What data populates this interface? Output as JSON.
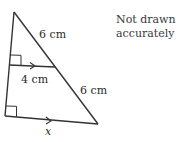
{
  "figure": {
    "note_line1": "Not drawn",
    "note_line2": "accurately",
    "labels": {
      "upper_hypotenuse": "6 cm",
      "lower_hypotenuse": "6 cm",
      "middle_parallel": "4 cm",
      "base_unknown": "x"
    },
    "line_color": "#333333"
  }
}
